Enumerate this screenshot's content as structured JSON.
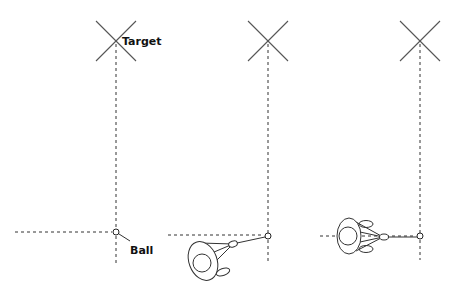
{
  "labels": {
    "target": "Target",
    "ball": "Ball"
  },
  "panels": [
    {
      "id": "panel-1",
      "description": "Target line and ball position only",
      "target": {
        "x": 116,
        "y": 41
      },
      "ball": {
        "x": 116,
        "y": 232
      },
      "has_golfer": false
    },
    {
      "id": "panel-2",
      "description": "Golfer addressing ball, angled stance",
      "target": {
        "x": 268,
        "y": 41
      },
      "ball": {
        "x": 268,
        "y": 236
      },
      "has_golfer": true
    },
    {
      "id": "panel-3",
      "description": "Golfer addressing ball, square stance parallel to line",
      "target": {
        "x": 420,
        "y": 41
      },
      "ball": {
        "x": 420,
        "y": 236
      },
      "has_golfer": true
    }
  ],
  "colors": {
    "line": "#333333",
    "cross": "#555555",
    "background": "#ffffff"
  }
}
